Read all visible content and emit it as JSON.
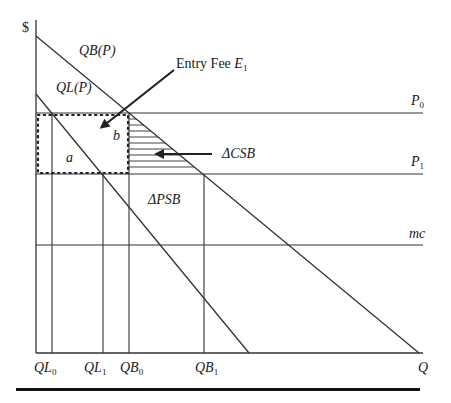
{
  "diagram": {
    "type": "economics-supply-demand",
    "axis": {
      "y_label": "$",
      "x_label": "Q"
    },
    "curves": [
      {
        "name": "QB(P)",
        "label": "QB(P)"
      },
      {
        "name": "QL(P)",
        "label": "QL(P)"
      }
    ],
    "price_levels": [
      {
        "name": "P0",
        "label": "P",
        "sub": "0"
      },
      {
        "name": "P1",
        "label": "P",
        "sub": "1"
      },
      {
        "name": "mc",
        "label": "mc"
      }
    ],
    "quantity_ticks": [
      {
        "name": "QL0",
        "label": "QL",
        "sub": "0"
      },
      {
        "name": "QL1",
        "label": "QL",
        "sub": "1"
      },
      {
        "name": "QB0",
        "label": "QB",
        "sub": "0"
      },
      {
        "name": "QB1",
        "label": "QB",
        "sub": "1"
      }
    ],
    "areas": {
      "a": "a",
      "b": "b",
      "delta_csb": "ΔCSB",
      "delta_psb": "ΔPSB"
    },
    "annotations": {
      "entry_fee": "Entry Fee ",
      "entry_fee_var": "E",
      "entry_fee_sub": "1"
    },
    "colors": {
      "line": "#333333",
      "background": "#ffffff"
    }
  }
}
